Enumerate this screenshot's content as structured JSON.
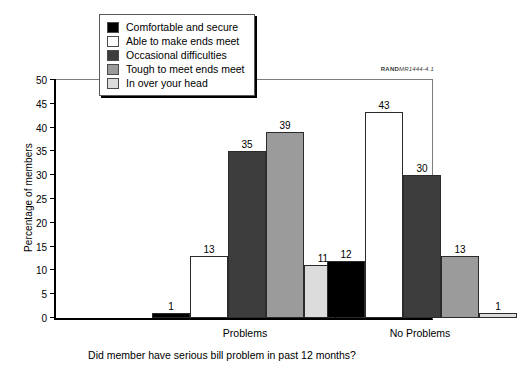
{
  "chart_data": {
    "type": "bar",
    "title": "",
    "xlabel": "Did member have serious bill problem in past 12 months?",
    "ylabel": "Percentage of members",
    "categories": [
      "Problems",
      "No Problems"
    ],
    "ylim": [
      0,
      50
    ],
    "yticks": [
      0,
      5,
      10,
      15,
      20,
      25,
      30,
      35,
      40,
      45,
      50
    ],
    "grid": false,
    "legend_position": "top-center",
    "series": [
      {
        "name": "Comfortable and secure",
        "color": "#000000",
        "values": [
          1,
          12
        ]
      },
      {
        "name": "Able to make ends meet",
        "color": "#ffffff",
        "values": [
          13,
          43
        ]
      },
      {
        "name": "Occasional difficulties",
        "color": "#3d3d3d",
        "values": [
          35,
          30
        ]
      },
      {
        "name": "Tough to meet ends meet",
        "color": "#9b9b9b",
        "values": [
          39,
          13
        ]
      },
      {
        "name": "In over your head",
        "color": "#dcdcdc",
        "values": [
          11,
          1
        ]
      }
    ]
  },
  "legend": {
    "items": [
      {
        "label": "Comfortable and secure",
        "color": "#000000"
      },
      {
        "label": "Able to make ends meet",
        "color": "#ffffff"
      },
      {
        "label": "Occasional difficulties",
        "color": "#3d3d3d"
      },
      {
        "label": "Tough to meet ends meet",
        "color": "#9b9b9b"
      },
      {
        "label": "In over your head",
        "color": "#dcdcdc"
      }
    ]
  },
  "source_id": {
    "brand": "RAND",
    "code": "MR1444-4.1"
  }
}
